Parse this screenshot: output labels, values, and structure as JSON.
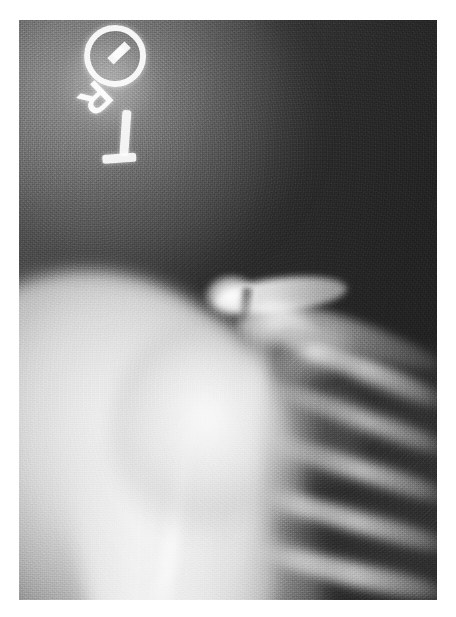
{
  "page": {
    "background_color": "#ffffff",
    "width": 456,
    "height": 617
  },
  "figure": {
    "name": "shoulder-radiograph",
    "modality": "X-ray",
    "view": "anteroposterior shoulder",
    "frame": {
      "x": 19,
      "y": 20,
      "width": 418,
      "height": 580
    },
    "palette": {
      "film_dark": "#232323",
      "film_mid": "#3a3a3a",
      "film_light": "#6a6a6a",
      "bone_bright": "#fafafa",
      "soft_tissue": "#dcdcdc",
      "page_white": "#ffffff"
    }
  },
  "marker": {
    "name": "radiopaque-side-marker",
    "letter": "R",
    "shape": "circle-with-letter",
    "rotation_degrees": 136,
    "dot_count": 3
  },
  "anatomy": [
    {
      "id": "soft-tissue-shoulder",
      "label": "Soft tissue shoulder contour"
    },
    {
      "id": "humeral-head",
      "label": "Humeral head"
    },
    {
      "id": "humeral-shaft",
      "label": "Proximal humeral shaft"
    },
    {
      "id": "clavicle",
      "label": "Clavicle"
    },
    {
      "id": "acromion",
      "label": "Acromion"
    },
    {
      "id": "ac-joint",
      "label": "Acromioclavicular joint"
    },
    {
      "id": "coracoid",
      "label": "Coracoid process"
    },
    {
      "id": "glenoid-shadow",
      "label": "Glenoid"
    },
    {
      "id": "scapula-spine",
      "label": "Scapular spine"
    },
    {
      "id": "lung-field",
      "label": "Lung field"
    },
    {
      "id": "ribs",
      "label": "Ribs"
    },
    {
      "id": "chest-wall-border",
      "label": "Chest wall border"
    }
  ],
  "overlay": {
    "exposure_glow_label": "Overexposed collimation glow",
    "grain_label": "Film grain"
  },
  "caption": ""
}
